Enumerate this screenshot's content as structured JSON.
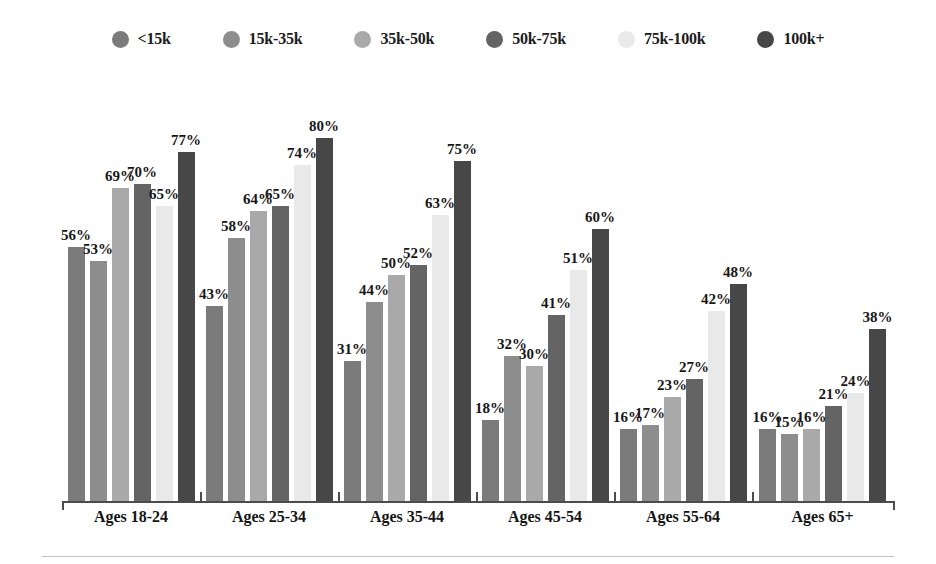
{
  "legend": {
    "items": [
      {
        "label": "<15k",
        "color": "#7b7b7b",
        "icon": "legend-dot-icon"
      },
      {
        "label": "15k-35k",
        "color": "#8d8d8d",
        "icon": "legend-dot-icon"
      },
      {
        "label": "35k-50k",
        "color": "#a9a9a9",
        "icon": "legend-dot-icon"
      },
      {
        "label": "50k-75k",
        "color": "#646464",
        "icon": "legend-dot-icon"
      },
      {
        "label": "75k-100k",
        "color": "#e9e9e9",
        "icon": "legend-dot-icon"
      },
      {
        "label": "100k+",
        "color": "#474747",
        "icon": "legend-dot-icon"
      }
    ]
  },
  "chart_data": {
    "type": "bar",
    "title": "",
    "subtitle": "",
    "xlabel": "",
    "ylabel": "",
    "ylim": [
      0,
      100
    ],
    "grid": false,
    "legend_position": "top-center",
    "value_label_suffix": "%",
    "categories": [
      "Ages 18-24",
      "Ages 25-34",
      "Ages 35-44",
      "Ages 45-54",
      "Ages 55-64",
      "Ages 65+"
    ],
    "series": [
      {
        "name": "<15k",
        "color": "#7b7b7b",
        "values": [
          56,
          43,
          31,
          18,
          16,
          16
        ]
      },
      {
        "name": "15k-35k",
        "color": "#8d8d8d",
        "values": [
          53,
          58,
          44,
          32,
          17,
          15
        ]
      },
      {
        "name": "35k-50k",
        "color": "#a9a9a9",
        "values": [
          69,
          64,
          50,
          30,
          23,
          16
        ]
      },
      {
        "name": "50k-75k",
        "color": "#646464",
        "values": [
          70,
          65,
          52,
          41,
          27,
          21
        ]
      },
      {
        "name": "75k-100k",
        "color": "#e9e9e9",
        "values": [
          65,
          74,
          63,
          51,
          42,
          24
        ]
      },
      {
        "name": "100k+",
        "color": "#474747",
        "values": [
          77,
          80,
          75,
          60,
          48,
          38
        ]
      }
    ],
    "labels": [
      [
        "56%",
        "53%",
        "69%",
        "70%",
        "65%",
        "77%"
      ],
      [
        "43%",
        "58%",
        "64%",
        "65%",
        "74%",
        "80%"
      ],
      [
        "31%",
        "44%",
        "50%",
        "52%",
        "63%",
        "75%"
      ],
      [
        "18%",
        "32%",
        "30%",
        "41%",
        "51%",
        "60%"
      ],
      [
        "16%",
        "17%",
        "23%",
        "27%",
        "42%",
        "48%"
      ],
      [
        "16%",
        "15%",
        "16%",
        "21%",
        "24%",
        "38%"
      ]
    ]
  },
  "axis": {
    "baseline_color": "#4c4c4c",
    "group_boundaries_px": [
      62,
      200,
      338,
      476,
      614,
      752,
      893
    ]
  }
}
